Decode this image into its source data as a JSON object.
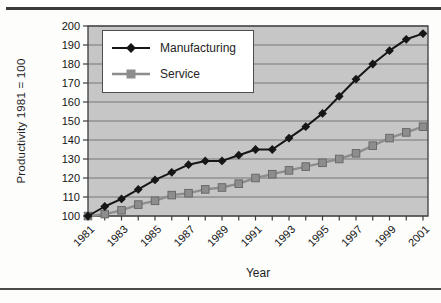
{
  "figure": {
    "top_rule": "decorative horizontal rule",
    "bottom_rule": "decorative horizontal rule"
  },
  "chart_data": {
    "type": "line",
    "title": "",
    "xlabel": "Year",
    "ylabel": "Productivity 1981 = 100",
    "x": [
      1981,
      1982,
      1983,
      1984,
      1985,
      1986,
      1987,
      1988,
      1989,
      1990,
      1991,
      1992,
      1993,
      1994,
      1995,
      1996,
      1997,
      1998,
      1999,
      2000,
      2001
    ],
    "x_tick_labels": [
      "1981",
      "1983",
      "1985",
      "1987",
      "1989",
      "1991",
      "1993",
      "1995",
      "1997",
      "1999",
      "2001"
    ],
    "y_ticks": [
      100,
      110,
      120,
      130,
      140,
      150,
      160,
      170,
      180,
      190,
      200
    ],
    "ylim": [
      100,
      200
    ],
    "series": [
      {
        "name": "Manufacturing",
        "marker": "diamond",
        "color": "#161616",
        "values": [
          100,
          105,
          109,
          114,
          119,
          123,
          127,
          129,
          129,
          132,
          135,
          135,
          141,
          147,
          154,
          163,
          172,
          180,
          187,
          193,
          196
        ]
      },
      {
        "name": "Service",
        "marker": "square",
        "color": "#8d8d8d",
        "marker_edge_color": "#646464",
        "values": [
          100,
          101,
          103,
          106,
          108,
          111,
          112,
          114,
          115,
          117,
          120,
          122,
          124,
          126,
          128,
          130,
          133,
          137,
          141,
          144,
          147
        ]
      }
    ],
    "grid": "horizontal",
    "gridline_color": "#767676",
    "plot_bg_color": "#c6c6c6",
    "axis_color": "#3c3c3c",
    "legend_position": "top-left-inside"
  }
}
